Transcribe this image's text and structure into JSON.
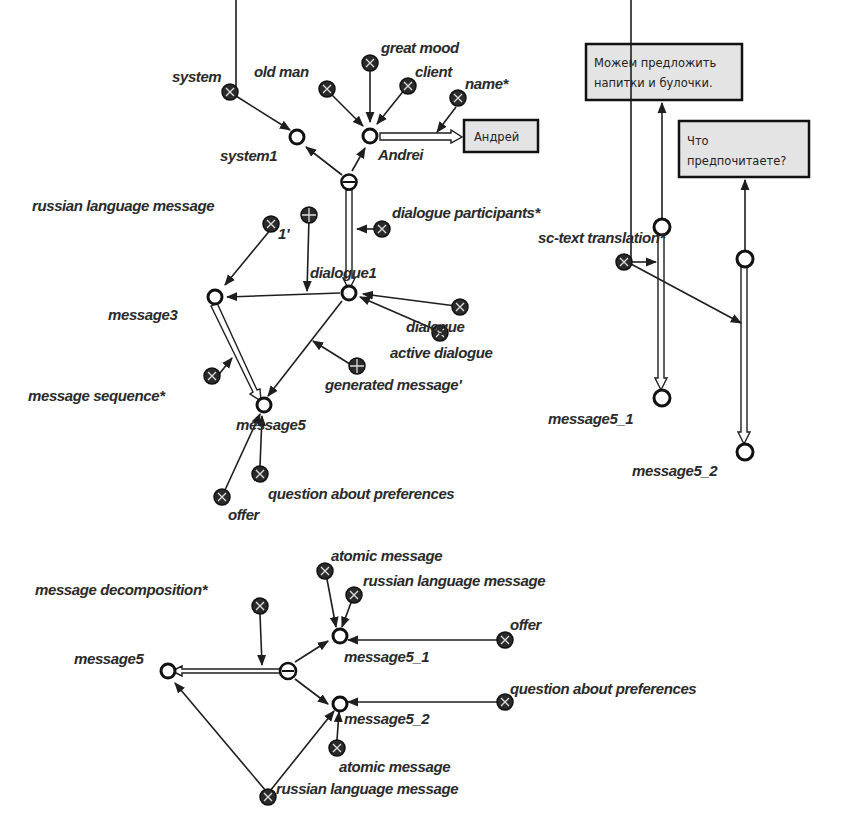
{
  "diagram": {
    "type": "semantic network (SC-code graph)",
    "fragments": {
      "top_left": {
        "nodes": {
          "system": "system",
          "old_man": "old man",
          "great_mood": "great mood",
          "client": "client",
          "name": "name*",
          "system1": "system1",
          "andrei": "Andrei",
          "andrei_value": "Андрей",
          "russian_language_message": "russian language message",
          "rel_1": "1'",
          "dialogue_participants": "dialogue participants*",
          "dialogue1": "dialogue1",
          "message3": "message3",
          "dialogue": "dialogue",
          "active_dialogue": "active dialogue",
          "generated_message": "generated message'",
          "message_sequence": "message sequence*",
          "message5": "message5",
          "question_about_preferences": "question about preferences",
          "offer": "offer"
        }
      },
      "top_right": {
        "nodes": {
          "text1": "Можем предложить напитки и булочки.",
          "text1_line1": "Можем предложить",
          "text1_line2": "напитки и булочки.",
          "text2_line1": "Что",
          "text2_line2": "предпочитаете?",
          "sc_text_translation": "sc-text translation*",
          "message5_1": "message5_1",
          "message5_2": "message5_2"
        }
      },
      "bottom": {
        "nodes": {
          "atomic_message_top": "atomic message",
          "russian_language_message_top": "russian language message",
          "message_decomposition": "message decomposition*",
          "offer": "offer",
          "message5": "message5",
          "message5_1": "message5_1",
          "question_about_preferences": "question about preferences",
          "message5_2": "message5_2",
          "atomic_message_bottom": "atomic message",
          "russian_language_message_bottom": "russian language message"
        }
      }
    }
  }
}
